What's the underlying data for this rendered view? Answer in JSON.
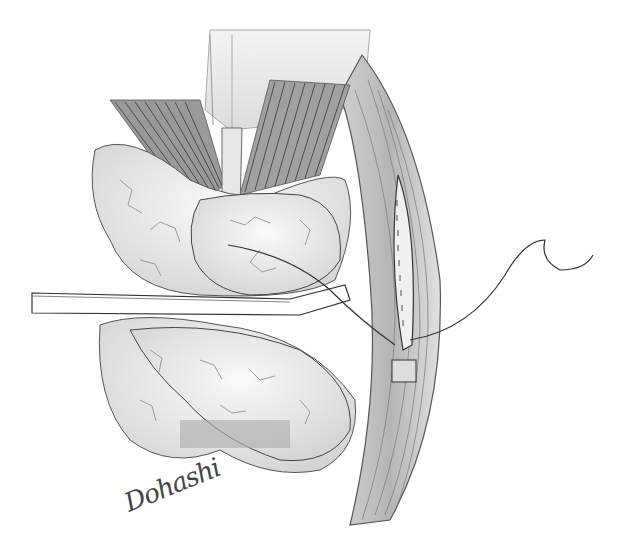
{
  "illustration": {
    "subject": "surgical-illustration-pencil",
    "signature": "Dohashi",
    "colors": {
      "background": "#ffffff",
      "line": "#3a3a3a",
      "shade": "#8a8a8a",
      "light_shade": "#d8d8d8"
    }
  }
}
